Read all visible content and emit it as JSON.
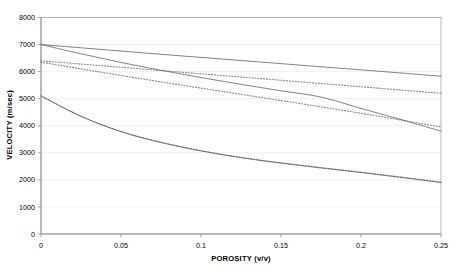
{
  "chart_data": {
    "type": "line",
    "title": "",
    "xlabel": "POROSITY (v/v)",
    "ylabel": "VELOCITY (m/sec)",
    "xlim": [
      0,
      0.25
    ],
    "ylim": [
      0,
      8000
    ],
    "xticks": [
      "0",
      "0.05",
      "0.1",
      "0.15",
      "0.2",
      "0.25"
    ],
    "xtick_values": [
      0,
      0.05,
      0.1,
      0.15,
      0.2,
      0.25
    ],
    "yticks": [
      "0",
      "1000",
      "2000",
      "3000",
      "4000",
      "5000",
      "6000",
      "7000",
      "8000"
    ],
    "ytick_values": [
      0,
      1000,
      2000,
      3000,
      4000,
      5000,
      6000,
      7000,
      8000
    ],
    "grid": "horizontal",
    "legend": "none",
    "line_color": "#6d6d6d",
    "x": [
      0,
      0.025,
      0.05,
      0.075,
      0.1,
      0.125,
      0.15,
      0.175,
      0.2,
      0.225,
      0.25
    ],
    "series": [
      {
        "name": "curve-1-solid-shallow",
        "style": "solid",
        "values": [
          7000,
          6880,
          6760,
          6640,
          6525,
          6410,
          6295,
          6180,
          6065,
          5950,
          5830
        ]
      },
      {
        "name": "curve-2-solid-steep",
        "style": "solid",
        "values": [
          7000,
          6660,
          6340,
          6050,
          5780,
          5530,
          5290,
          5060,
          4640,
          4230,
          3800
        ]
      },
      {
        "name": "curve-3-dotted-shallow",
        "style": "dotted",
        "values": [
          6400,
          6280,
          6160,
          6040,
          5920,
          5800,
          5680,
          5560,
          5440,
          5320,
          5200
        ]
      },
      {
        "name": "curve-4-dotted-steep",
        "style": "dotted",
        "values": [
          6350,
          6100,
          5860,
          5620,
          5390,
          5160,
          4930,
          4700,
          4460,
          4210,
          3950
        ]
      },
      {
        "name": "curve-5-solid-concave",
        "style": "solid",
        "values": [
          5100,
          4350,
          3780,
          3380,
          3070,
          2820,
          2620,
          2440,
          2270,
          2090,
          1900
        ]
      },
      {
        "name": "curve-5-dotted-overlay",
        "style": "dotted",
        "values": [
          5100,
          4350,
          3790,
          3390,
          3080,
          2830,
          2630,
          2455,
          2285,
          2105,
          1915
        ]
      }
    ]
  }
}
